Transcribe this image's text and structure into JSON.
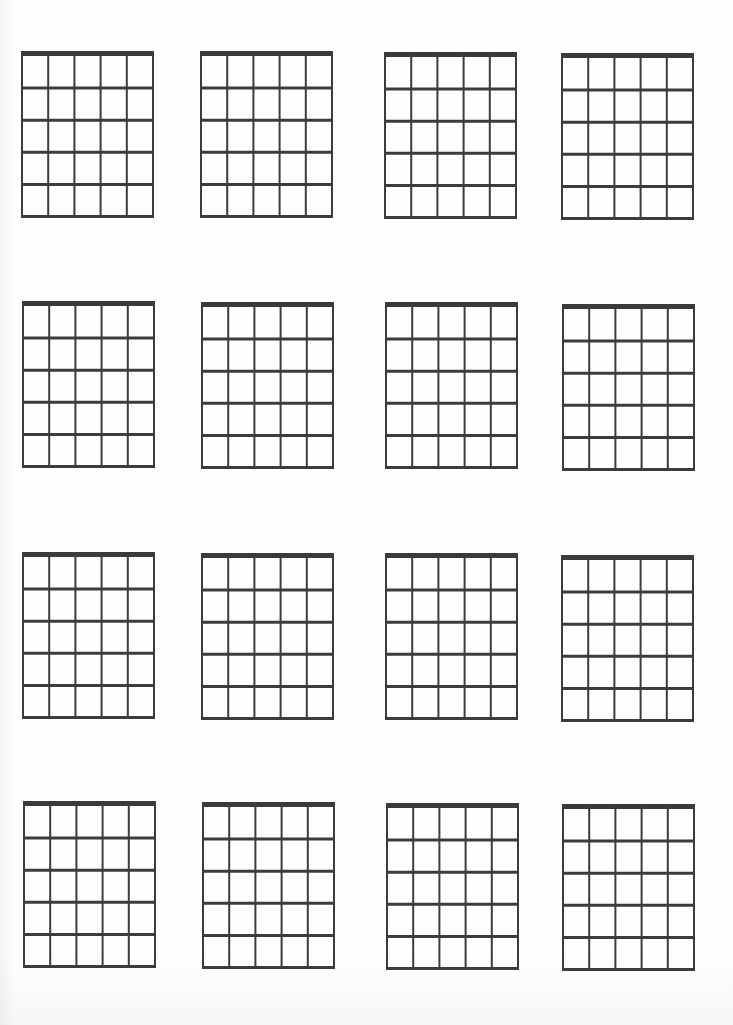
{
  "document": {
    "type": "blank-chord-chart-sheet",
    "rows": 4,
    "columns": 4,
    "grid_count": 16
  },
  "chord_grid_spec": {
    "strings": 6,
    "frets": 5,
    "nut_thickness_px": 5,
    "string_line_px": 2,
    "fret_line_px": 3,
    "line_color": "#3c3c3c",
    "nut_color": "#3a3a3a",
    "background_color": "#ffffff"
  },
  "grids": [
    {
      "row": 1,
      "col": 1,
      "x": 21,
      "y": 51
    },
    {
      "row": 1,
      "col": 2,
      "x": 200,
      "y": 51
    },
    {
      "row": 1,
      "col": 3,
      "x": 384,
      "y": 52
    },
    {
      "row": 1,
      "col": 4,
      "x": 561,
      "y": 53
    },
    {
      "row": 2,
      "col": 1,
      "x": 22,
      "y": 301
    },
    {
      "row": 2,
      "col": 2,
      "x": 201,
      "y": 302
    },
    {
      "row": 2,
      "col": 3,
      "x": 385,
      "y": 302
    },
    {
      "row": 2,
      "col": 4,
      "x": 562,
      "y": 304
    },
    {
      "row": 3,
      "col": 1,
      "x": 22,
      "y": 552
    },
    {
      "row": 3,
      "col": 2,
      "x": 201,
      "y": 553
    },
    {
      "row": 3,
      "col": 3,
      "x": 385,
      "y": 553
    },
    {
      "row": 3,
      "col": 4,
      "x": 561,
      "y": 555
    },
    {
      "row": 4,
      "col": 1,
      "x": 23,
      "y": 801
    },
    {
      "row": 4,
      "col": 2,
      "x": 202,
      "y": 802
    },
    {
      "row": 4,
      "col": 3,
      "x": 386,
      "y": 803
    },
    {
      "row": 4,
      "col": 4,
      "x": 562,
      "y": 804
    }
  ]
}
